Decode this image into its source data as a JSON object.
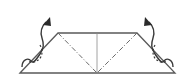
{
  "diagram": {
    "type": "origami-fold-step",
    "elements": {
      "paper_outline": "trapezoid",
      "center_crease": "vertical crease line",
      "valley_folds": [
        "left diagonal dash-dot line",
        "right diagonal dash-dot line"
      ],
      "arrows": [
        "left curved up arrow",
        "right curved up arrow"
      ],
      "hidden_lines": [
        "left dotted hidden flap curve",
        "right dotted hidden flap curve"
      ]
    },
    "colors": {
      "line": "#5a5a5a",
      "arrow": "#2a2a2a",
      "background": "#ffffff"
    }
  }
}
